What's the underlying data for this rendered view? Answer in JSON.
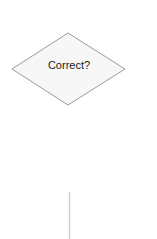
{
  "diagram": {
    "decision": {
      "label": "Correct?",
      "fill": "#f7f7f7",
      "stroke": "#9a9a9a"
    },
    "connector": {
      "stroke": "#c8c8c8"
    }
  }
}
